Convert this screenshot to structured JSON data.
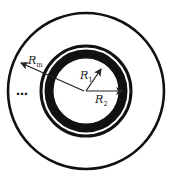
{
  "diagram": {
    "center": [
      86,
      91
    ],
    "circles": [
      {
        "name": "outer-boundary",
        "r": 78,
        "stroke": 3
      },
      {
        "name": "thin-ring",
        "r": 45,
        "stroke": 3
      },
      {
        "name": "thick-ring",
        "r": 37,
        "stroke": 9
      }
    ],
    "labels": {
      "rm": {
        "base": "R",
        "sub": "m"
      },
      "r1": {
        "base": "R",
        "sub": "1"
      },
      "r2": {
        "base": "R",
        "sub": "2"
      },
      "ellipsis": "…"
    },
    "colors": {
      "line": "#111111",
      "arrow": "#222222"
    }
  }
}
